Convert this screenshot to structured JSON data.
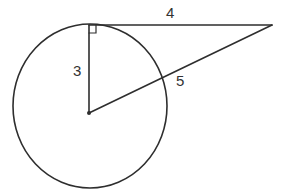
{
  "diagram": {
    "type": "circle-tangent",
    "colors": {
      "line": "#2e2e2e",
      "text": "#333333",
      "background": "#ffffff"
    },
    "circle": {
      "cx": 90,
      "cy": 107,
      "rx": 77,
      "ry": 82
    },
    "center_point": {
      "x": 89,
      "y": 113
    },
    "tangent_point": {
      "x": 89,
      "y": 25
    },
    "external_point": {
      "x": 272,
      "y": 25
    },
    "labels": {
      "radius": "3",
      "tangent": "4",
      "secant": "5"
    },
    "right_angle_marker": true
  }
}
